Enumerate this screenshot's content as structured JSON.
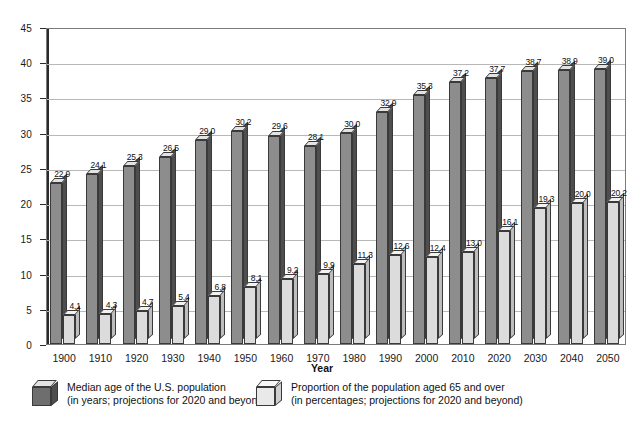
{
  "chart_data": {
    "type": "bar",
    "title": "",
    "subtitle": "",
    "xlabel": "Year",
    "ylabel": "",
    "ylim": [
      0,
      45
    ],
    "yticks": [
      0,
      5,
      10,
      15,
      20,
      25,
      30,
      35,
      40,
      45
    ],
    "grid": true,
    "legend_position": "bottom",
    "categories": [
      "1900",
      "1910",
      "1920",
      "1930",
      "1940",
      "1950",
      "1960",
      "1970",
      "1980",
      "1990",
      "2000",
      "2010",
      "2020",
      "2030",
      "2040",
      "2050"
    ],
    "series": [
      {
        "name": "Median age of the U.S. population",
        "units": "years",
        "note": "projections for 2020 and beyond",
        "color": "#8d8d8d",
        "values": [
          22.9,
          24.1,
          25.3,
          26.5,
          29.0,
          30.2,
          29.6,
          28.1,
          30.0,
          32.9,
          35.3,
          37.2,
          37.7,
          38.7,
          38.9,
          39.0
        ],
        "labels": [
          "22.9",
          "24.1",
          "25.3",
          "26.5",
          "29.0",
          "30.2",
          "29.6",
          "28.1",
          "30.0",
          "32.9",
          "35.3",
          "37.2",
          "37.7",
          "38.7",
          "38.9",
          "39.0"
        ]
      },
      {
        "name": "Proportion of the population aged 65 and over",
        "units": "percentages",
        "note": "projections for 2020 and beyond",
        "color": "#dcdcdc",
        "values": [
          4.1,
          4.3,
          4.7,
          5.4,
          6.8,
          8.1,
          9.2,
          9.9,
          11.3,
          12.6,
          12.4,
          13.0,
          16.1,
          19.3,
          20.0,
          20.2
        ],
        "labels": [
          "4.1",
          "4.3",
          "4.7",
          "5.4",
          "6.8",
          "8.1",
          "9.2",
          "9.9",
          "11.3",
          "12.6",
          "12.4",
          "13.0",
          "16.1",
          "19.3",
          "20.0",
          "20.2"
        ]
      }
    ]
  },
  "legend": [
    {
      "swatch": "dark-cube-icon",
      "line1": "Median age of the U.S. population",
      "line2": "(in years; projections for 2020 and beyond)"
    },
    {
      "swatch": "light-cube-icon",
      "line1": "Proportion of the population aged 65 and over",
      "line2": "(in percentages; projections for 2020 and beyond)"
    }
  ],
  "axis": {
    "x_title": "Year"
  }
}
